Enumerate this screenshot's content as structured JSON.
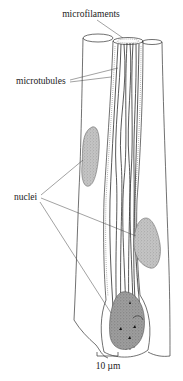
{
  "figure": {
    "type": "biological line drawing",
    "labels": {
      "microfilaments": "microfilaments",
      "microtubules": "microtubules",
      "nuclei": "nuclei"
    },
    "scale_bar": {
      "label": "10 µm"
    },
    "structures": {
      "cells": [
        "left cell",
        "center cell",
        "right cell"
      ],
      "nuclei_count": 3,
      "microtubule_bundle": "longitudinal bundle in center cell"
    },
    "colors": {
      "line": "#222222",
      "nucleus_fill": "#b5b5b5",
      "nucleus_dark_fill": "#8f8f8f",
      "background": "#ffffff"
    }
  }
}
